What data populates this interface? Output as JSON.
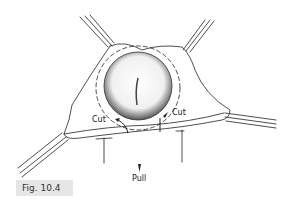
{
  "figure": {
    "label": "Fig. 10.4",
    "annotations": {
      "cut_left": "Cut",
      "cut_right": "Cut",
      "pull": "Pull"
    },
    "colors": {
      "line": "#222222",
      "label_bg": "#e6e6e6"
    }
  }
}
